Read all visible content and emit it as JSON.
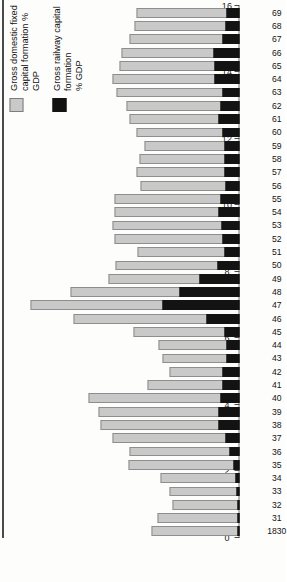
{
  "chart_data": {
    "type": "bar",
    "title": "",
    "subtitle": "",
    "xlabel": "",
    "ylabel": "",
    "orientation": "horizontal-rotated",
    "grid": false,
    "legend_position": "top-left",
    "ylim": [
      0,
      16
    ],
    "ytick_step": 2,
    "yticks": [
      0,
      2,
      4,
      6,
      8,
      10,
      12,
      14,
      16
    ],
    "ytick_labels": [
      "0",
      "2",
      "4",
      "6",
      "8",
      "10",
      "12",
      "14",
      "16"
    ],
    "categories": [
      "1830",
      "31",
      "32",
      "33",
      "34",
      "35",
      "36",
      "37",
      "38",
      "39",
      "40",
      "41",
      "42",
      "43",
      "44",
      "45",
      "46",
      "47",
      "48",
      "49",
      "50",
      "51",
      "52",
      "53",
      "54",
      "55",
      "56",
      "57",
      "58",
      "59",
      "60",
      "61",
      "62",
      "63",
      "64",
      "65",
      "66",
      "67",
      "68",
      "69"
    ],
    "series": [
      {
        "name": "Gross domestic fixed capital formation % GDP",
        "color": "#c9c9c9",
        "values": [
          6.3,
          5.9,
          4.8,
          5.0,
          5.7,
          8.0,
          7.9,
          9.1,
          10.0,
          10.1,
          10.8,
          6.6,
          5.0,
          5.5,
          5.8,
          7.6,
          11.9,
          15.0,
          12.1,
          9.4,
          8.9,
          7.3,
          9.0,
          9.1,
          9.0,
          9.0,
          7.1,
          7.4,
          7.2,
          6.8,
          7.4,
          7.9,
          8.1,
          8.8,
          9.1,
          8.6,
          8.5,
          7.9,
          7.5,
          7.4
        ]
      },
      {
        "name": "Gross railway capital formation % GDP",
        "color": "#131313",
        "values": [
          0.1,
          0.1,
          0.1,
          0.2,
          0.3,
          0.4,
          0.7,
          1.0,
          1.5,
          1.5,
          1.4,
          1.2,
          1.2,
          0.9,
          0.9,
          1.1,
          2.4,
          5.5,
          4.3,
          2.9,
          1.6,
          1.1,
          1.2,
          1.3,
          1.5,
          1.4,
          1.0,
          1.1,
          1.1,
          1.1,
          1.2,
          1.5,
          1.4,
          1.2,
          1.8,
          1.8,
          1.9,
          1.2,
          1.0,
          0.9
        ]
      }
    ]
  },
  "legend": {
    "items": [
      {
        "label": "Gross domestic fixed\ncapital formation % GDP",
        "swatch": "gdfcf"
      },
      {
        "label": "Gross railway capital formation\n% GDP",
        "swatch": "rail"
      }
    ]
  }
}
